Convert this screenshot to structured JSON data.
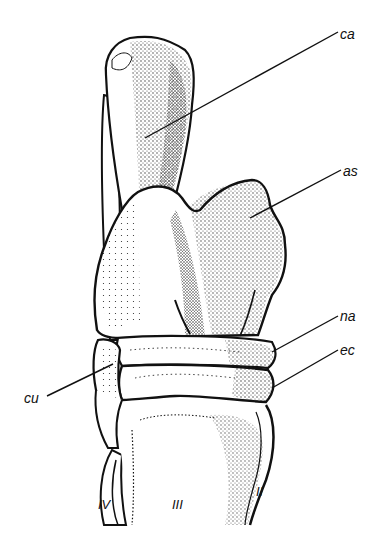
{
  "figure": {
    "colors": {
      "ink": "#111111",
      "background": "#ffffff"
    },
    "labels": [
      {
        "id": "ca",
        "text": "ca",
        "x": 340,
        "y": 27
      },
      {
        "id": "as",
        "text": "as",
        "x": 343,
        "y": 165
      },
      {
        "id": "na",
        "text": "na",
        "x": 340,
        "y": 310
      },
      {
        "id": "ec",
        "text": "ec",
        "x": 340,
        "y": 344
      },
      {
        "id": "cu",
        "text": "cu",
        "x": 24,
        "y": 392
      },
      {
        "id": "mt4",
        "text": "IV",
        "x": 97,
        "y": 495
      },
      {
        "id": "mt3",
        "text": "III",
        "x": 170,
        "y": 495
      },
      {
        "id": "mt2",
        "text": "II",
        "x": 255,
        "y": 485
      }
    ]
  }
}
